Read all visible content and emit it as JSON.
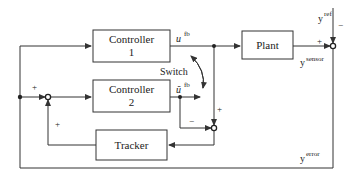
{
  "blocks": {
    "controller1": {
      "line1": "Controller",
      "line2": "1"
    },
    "controller2": {
      "line1": "Controller",
      "line2": "2"
    },
    "plant": {
      "label": "Plant"
    },
    "tracker": {
      "label": "Tracker"
    }
  },
  "signals": {
    "u_fb": {
      "base": "u",
      "sup": "fb"
    },
    "u_tilde_fb": {
      "base": "ũ",
      "sup": "fb"
    },
    "y_ref": {
      "base": "y",
      "sup": "ref"
    },
    "y_sensor": {
      "base": "y",
      "sup": "sensor"
    },
    "y_error": {
      "base": "y",
      "sup": "error"
    }
  },
  "switch": {
    "label": "Switch"
  },
  "signs": {
    "right_sum_plus": "+",
    "right_sum_minus": "−",
    "left_sum_top_plus": "+",
    "left_sum_bottom_plus": "+",
    "mid_sum_plus": "+",
    "mid_sum_minus": "−"
  },
  "colors": {
    "line": "#333333",
    "background": "#ffffff"
  }
}
